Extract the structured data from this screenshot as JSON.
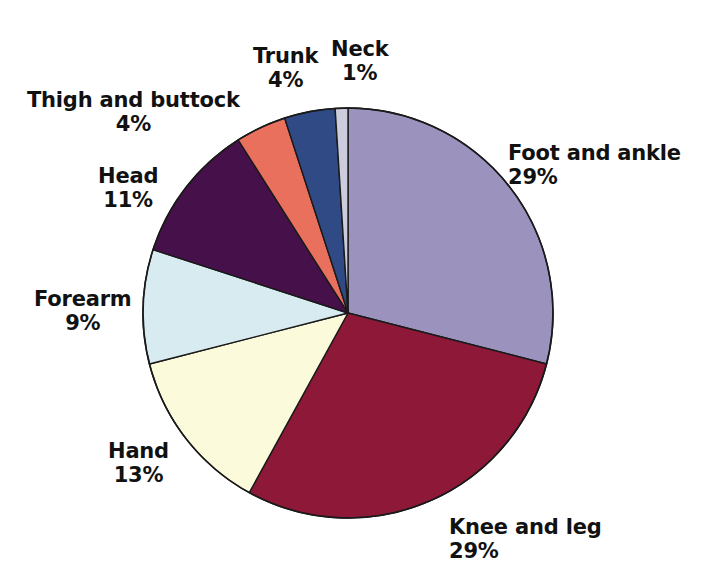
{
  "chart_data": {
    "type": "pie",
    "title": "",
    "subtitle": "",
    "xlabel": "",
    "ylabel": "",
    "legend_position": "none",
    "grid": false,
    "label_format": "name over percent",
    "start_angle_deg": 0,
    "direction": "clockwise",
    "categories": [
      "Foot and ankle",
      "Knee and leg",
      "Hand",
      "Forearm",
      "Head",
      "Thigh and buttock",
      "Trunk",
      "Neck"
    ],
    "values": [
      29,
      29,
      13,
      9,
      11,
      4,
      4,
      1
    ],
    "value_labels": [
      "29%",
      "29%",
      "13%",
      "9%",
      "11%",
      "4%",
      "4%",
      "1%"
    ],
    "colors": [
      "#9b93bd",
      "#8e1838",
      "#fbfbdc",
      "#d7ebf0",
      "#46104a",
      "#e8705c",
      "#2f4a84",
      "#ccccdd"
    ],
    "slice_outline_color": "#1a1a1a",
    "background_color": "#ffffff",
    "slices": [
      {
        "name": "Foot and ankle",
        "value": 29,
        "value_label": "29%",
        "color": "#9b93bd"
      },
      {
        "name": "Knee and leg",
        "value": 29,
        "value_label": "29%",
        "color": "#8e1838"
      },
      {
        "name": "Hand",
        "value": 13,
        "value_label": "13%",
        "color": "#fbfbdc"
      },
      {
        "name": "Forearm",
        "value": 9,
        "value_label": "9%",
        "color": "#d7ebf0"
      },
      {
        "name": "Head",
        "value": 11,
        "value_label": "11%",
        "color": "#46104a"
      },
      {
        "name": "Thigh and buttock",
        "value": 4,
        "value_label": "4%",
        "color": "#e8705c"
      },
      {
        "name": "Trunk",
        "value": 4,
        "value_label": "4%",
        "color": "#2f4a84"
      },
      {
        "name": "Neck",
        "value": 1,
        "value_label": "1%",
        "color": "#ccccdd"
      }
    ]
  },
  "labels": {
    "foot_and_ankle": {
      "name": "Foot and ankle",
      "value": "29%"
    },
    "knee_and_leg": {
      "name": "Knee and leg",
      "value": "29%"
    },
    "hand": {
      "name": "Hand",
      "value": "13%"
    },
    "forearm": {
      "name": "Forearm",
      "value": "9%"
    },
    "head": {
      "name": "Head",
      "value": "11%"
    },
    "thigh_and_buttock": {
      "name": "Thigh and buttock",
      "value": "4%"
    },
    "trunk": {
      "name": "Trunk",
      "value": "4%"
    },
    "neck": {
      "name": "Neck",
      "value": "1%"
    }
  },
  "geometry": {
    "center_x": 348,
    "center_y": 313,
    "radius": 205
  }
}
